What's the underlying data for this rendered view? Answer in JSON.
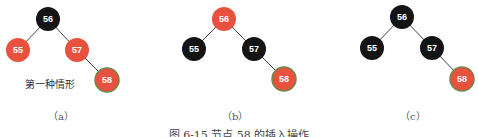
{
  "diagrams": [
    {
      "id": "a",
      "sub_label": "（a）",
      "note": "第一种情形",
      "nodes": [
        {
          "key": "56",
          "color": "black",
          "x": 48,
          "y": 19
        },
        {
          "key": "55",
          "color": "red",
          "x": 18,
          "y": 50
        },
        {
          "key": "57",
          "color": "red",
          "x": 77,
          "y": 50
        },
        {
          "key": "58",
          "color": "red",
          "x": 107,
          "y": 80,
          "highlight": true
        }
      ]
    },
    {
      "id": "b",
      "sub_label": "（b）",
      "nodes": [
        {
          "key": "56",
          "color": "red",
          "x": 224,
          "y": 19
        },
        {
          "key": "55",
          "color": "black",
          "x": 194,
          "y": 49
        },
        {
          "key": "57",
          "color": "black",
          "x": 254,
          "y": 49
        },
        {
          "key": "58",
          "color": "red",
          "x": 284,
          "y": 79,
          "highlight": true
        }
      ]
    },
    {
      "id": "c",
      "sub_label": "（c）",
      "nodes": [
        {
          "key": "56",
          "color": "black",
          "x": 402,
          "y": 17
        },
        {
          "key": "55",
          "color": "black",
          "x": 372,
          "y": 48
        },
        {
          "key": "57",
          "color": "black",
          "x": 432,
          "y": 48
        },
        {
          "key": "58",
          "color": "red",
          "x": 462,
          "y": 79,
          "highlight": true
        }
      ]
    }
  ],
  "colors": {
    "red": "#e8513d",
    "black": "#141414",
    "highlight_ring": "#6a8a4a",
    "edge": "#444444"
  },
  "caption": "图 6-15  节点 58 的插入操作"
}
